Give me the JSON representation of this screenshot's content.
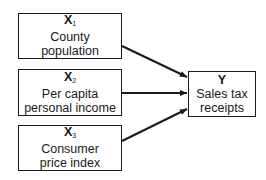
{
  "diagram": {
    "type": "causal-model",
    "inputs": [
      {
        "symbol": "X",
        "subscript": "1",
        "label_line1": "County",
        "label_line2": "population"
      },
      {
        "symbol": "X",
        "subscript": "2",
        "label_line1": "Per capita",
        "label_line2": "personal income"
      },
      {
        "symbol": "X",
        "subscript": "3",
        "label_line1": "Consumer",
        "label_line2": "price index"
      }
    ],
    "output": {
      "symbol": "Y",
      "label_line1": "Sales tax",
      "label_line2": "receipts"
    },
    "edges": [
      {
        "from": "X1",
        "to": "Y"
      },
      {
        "from": "X2",
        "to": "Y"
      },
      {
        "from": "X3",
        "to": "Y"
      }
    ]
  }
}
